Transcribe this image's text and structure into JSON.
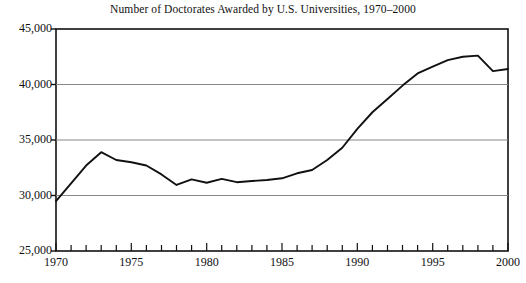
{
  "chart_data": {
    "type": "line",
    "title": "Number of Doctorates Awarded by U.S. Universities, 1970–2000",
    "xlabel": "",
    "ylabel": "",
    "xlim": [
      1970,
      2000
    ],
    "ylim": [
      25000,
      45000
    ],
    "grid": true,
    "grid_orientation": "horizontal",
    "legend": "none",
    "y_ticks": [
      25000,
      30000,
      35000,
      40000,
      45000
    ],
    "y_tick_labels": [
      "25,000",
      "30,000",
      "35,000",
      "40,000",
      "45,000"
    ],
    "x_ticks": [
      1970,
      1971,
      1972,
      1973,
      1974,
      1975,
      1976,
      1977,
      1978,
      1979,
      1980,
      1981,
      1982,
      1983,
      1984,
      1985,
      1986,
      1987,
      1988,
      1989,
      1990,
      1991,
      1992,
      1993,
      1994,
      1995,
      1996,
      1997,
      1998,
      1999,
      2000
    ],
    "x_tick_labels_shown": [
      "1970",
      "1975",
      "1980",
      "1985",
      "1990",
      "1995",
      "2000"
    ],
    "x_tick_label_years": [
      1970,
      1975,
      1980,
      1985,
      1990,
      1995,
      2000
    ],
    "x": [
      1970,
      1971,
      1972,
      1973,
      1974,
      1975,
      1976,
      1977,
      1978,
      1979,
      1980,
      1981,
      1982,
      1983,
      1984,
      1985,
      1986,
      1987,
      1988,
      1989,
      1990,
      1991,
      1992,
      1993,
      1994,
      1995,
      1996,
      1997,
      1998,
      1999,
      2000
    ],
    "values": [
      29500,
      31100,
      32700,
      33900,
      33200,
      33000,
      32700,
      31900,
      30950,
      31450,
      31150,
      31500,
      31200,
      31300,
      31400,
      31550,
      32000,
      32300,
      33200,
      34300,
      36000,
      37500,
      38700,
      39900,
      41000,
      41600,
      42200,
      42500,
      42600,
      41200,
      41400
    ],
    "series": [
      {
        "name": "Doctorates awarded",
        "color": "#111111",
        "values": [
          29500,
          31100,
          32700,
          33900,
          33200,
          33000,
          32700,
          31900,
          30950,
          31450,
          31150,
          31500,
          31200,
          31300,
          31400,
          31550,
          32000,
          32300,
          33200,
          34300,
          36000,
          37500,
          38700,
          39900,
          41000,
          41600,
          42200,
          42500,
          42600,
          41200,
          41400
        ]
      }
    ],
    "colors": {
      "line": "#111111",
      "axis": "#111111",
      "grid": "#888888",
      "background": "#ffffff"
    }
  }
}
